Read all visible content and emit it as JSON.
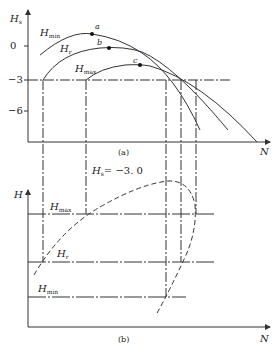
{
  "figure": {
    "top": {
      "caption": "(a)",
      "y_axis_label": "H",
      "y_axis_sub": "s",
      "x_axis_label": "N",
      "y_ticks": [
        "0",
        "−3",
        "−6"
      ],
      "curves": [
        {
          "name": "H",
          "sub": "min",
          "point": "a"
        },
        {
          "name": "H",
          "sub": "r",
          "point": "b"
        },
        {
          "name": "H",
          "sub": "max",
          "point": "c"
        }
      ]
    },
    "bottom": {
      "caption": "(b)",
      "y_axis_label": "H",
      "x_axis_label": "N",
      "annotation": "H",
      "annotation_sub": "s",
      "annotation_value": "= −3. 0",
      "levels": [
        {
          "name": "H",
          "sub": "max"
        },
        {
          "name": "H",
          "sub": "r"
        },
        {
          "name": "H",
          "sub": "min"
        }
      ]
    }
  }
}
